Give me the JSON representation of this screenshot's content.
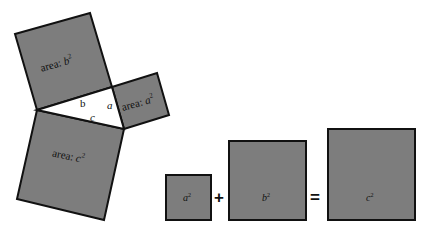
{
  "figure": {
    "colors": {
      "square_fill": "#7d7d7d",
      "stroke": "#111111",
      "background": "#ffffff",
      "triangle_fill": "#ffffff"
    },
    "left": {
      "square_b": {
        "label_prefix": "area: ",
        "label_var": "b",
        "sup": "2"
      },
      "square_a": {
        "label_prefix": "area: ",
        "label_var": "a",
        "sup": "2"
      },
      "square_c": {
        "label_prefix": "area: ",
        "label_var": "c",
        "sup": "2"
      },
      "triangle": {
        "side_a": "a",
        "side_b": "b",
        "side_c": "c"
      }
    },
    "equation": {
      "term1": {
        "var": "a",
        "sup": "2"
      },
      "plus": "+",
      "term2": {
        "var": "b",
        "sup": "2"
      },
      "equals": "=",
      "term3": {
        "var": "c",
        "sup": "2"
      }
    }
  }
}
